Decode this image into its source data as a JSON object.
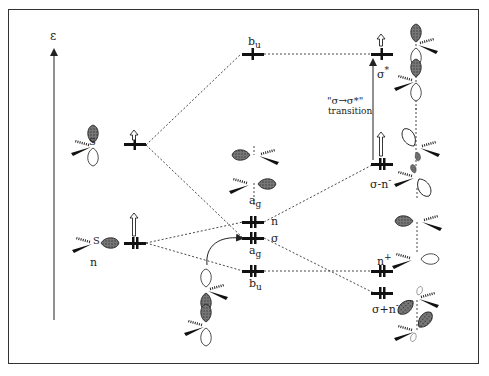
{
  "diagram": {
    "type": "molecular-orbital-diagram",
    "axis": {
      "label": "ε"
    },
    "left_fragment": {
      "levels": [
        {
          "id": "sp-upper",
          "electrons": "↑ (excited, hollow arrow)"
        },
        {
          "id": "n-left",
          "label": "n",
          "electrons": "2"
        }
      ]
    },
    "middle_levels": [
      {
        "id": "bu-top",
        "label": "bᵤ",
        "sub": "u",
        "base": "b"
      },
      {
        "id": "ag-n",
        "label_top": "a",
        "sub_top": "g",
        "label_right": "n"
      },
      {
        "id": "ag-sigma",
        "label_right": "σ",
        "label_bottom": "a",
        "sub_bottom": "g"
      },
      {
        "id": "bu-bottom",
        "label": "b",
        "sub": "u"
      }
    ],
    "right_levels": [
      {
        "id": "sigma-star",
        "label": "σ",
        "sup": "*"
      },
      {
        "id": "sigma-minus-n",
        "label": "σ-n",
        "sup": "-"
      },
      {
        "id": "n-plus",
        "label": "n",
        "sup": "+"
      },
      {
        "id": "sigma-plus-n",
        "label": "σ+n",
        "sup": "-"
      }
    ],
    "transition": {
      "line1": "\"σ→σ*\"",
      "line2": "transition"
    },
    "atom_label": "S"
  }
}
